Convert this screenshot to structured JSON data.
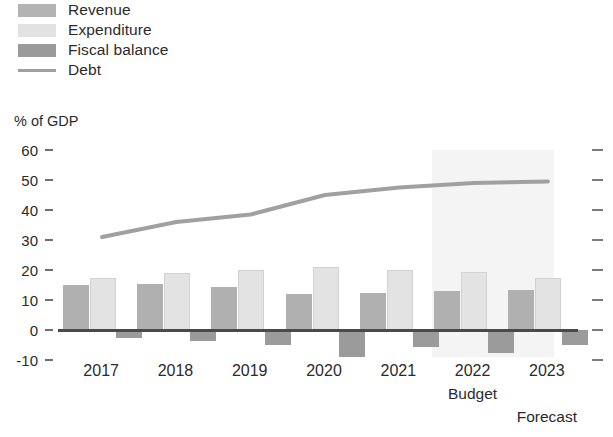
{
  "chart_data": {
    "type": "bar",
    "title": "",
    "subtitle": "",
    "xlabel": "",
    "ylabel": "% of GDP",
    "ylim": [
      -10,
      60
    ],
    "yticks": [
      60,
      50,
      40,
      30,
      20,
      10,
      0,
      -10
    ],
    "ytick_labels": [
      "60",
      "50",
      "40",
      "30",
      "20",
      "10",
      "0",
      "-10"
    ],
    "grid": false,
    "legend_position": "top-left",
    "categories": [
      "2017",
      "2018",
      "2019",
      "2020",
      "2021",
      "2022",
      "2023"
    ],
    "category_sublabels": [
      "",
      "",
      "",
      "",
      "",
      "Budget",
      "Forecast"
    ],
    "series": [
      {
        "name": "Revenue",
        "type": "bar",
        "color": "#b0b0b0",
        "values": [
          15.0,
          15.5,
          14.5,
          12.0,
          12.5,
          13.0,
          13.5
        ]
      },
      {
        "name": "Expenditure",
        "type": "bar",
        "color": "#e3e3e3",
        "values": [
          17.5,
          19.0,
          20.0,
          21.0,
          20.0,
          19.5,
          17.5
        ]
      },
      {
        "name": "Fiscal balance",
        "type": "bar",
        "color": "#9b9b9b",
        "values": [
          -2.5,
          -3.5,
          -5.0,
          -9.0,
          -5.5,
          -7.5,
          -5.0
        ]
      },
      {
        "name": "Debt",
        "type": "line",
        "color": "#a0a0a0",
        "values": [
          31.0,
          36.0,
          38.5,
          45.0,
          47.5,
          49.0,
          49.5
        ]
      }
    ],
    "annotations": [
      {
        "text": "Budget",
        "category": "2022"
      },
      {
        "text": "Forecast",
        "category": "2023"
      }
    ],
    "shaded_region": {
      "label": "forecast",
      "from_category": "2022",
      "to_category": "2023",
      "color": "#f4f4f4"
    }
  },
  "legend": {
    "items": [
      {
        "label": "Revenue",
        "swatch": "revenue-swatch"
      },
      {
        "label": "Expenditure",
        "swatch": "expenditure-swatch"
      },
      {
        "label": "Fiscal balance",
        "swatch": "fiscal-balance-swatch"
      },
      {
        "label": "Debt",
        "swatch": "debt-line-swatch"
      }
    ]
  },
  "axis": {
    "y_title": "% of GDP"
  }
}
